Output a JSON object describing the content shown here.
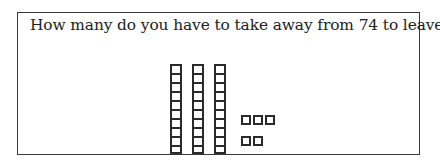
{
  "question": {
    "text": "How many do you have to take away from 74 to leave"
  },
  "base_ten_blocks": {
    "tens_rods": 3,
    "cells_per_rod": 10,
    "ones_units": 5,
    "ones_rows": [
      3,
      2
    ],
    "represented_value": 35
  },
  "colors": {
    "border": "#3a3a3a",
    "block_stroke": "#2a2a2a",
    "text": "#222222",
    "background": "#ffffff"
  }
}
